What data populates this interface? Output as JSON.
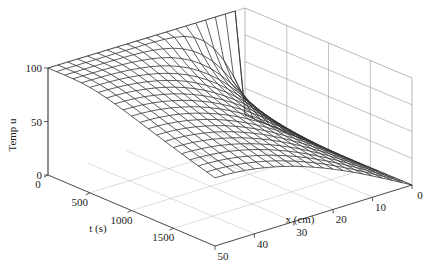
{
  "chart_data": {
    "type": "surface",
    "title": "",
    "zlabel": "Temp u",
    "tlabel": "t (s)",
    "xlabel": "x (cm)",
    "z_ticks": [
      0,
      50,
      100
    ],
    "t_ticks": [
      0,
      500,
      1000,
      1500
    ],
    "x_ticks": [
      0,
      10,
      20,
      30,
      40,
      50
    ],
    "zlim": [
      0,
      100
    ],
    "tlim": [
      0,
      2000
    ],
    "xlim": [
      0,
      50
    ],
    "grid": true,
    "mesh": {
      "nx": 21,
      "nt": 21
    }
  }
}
